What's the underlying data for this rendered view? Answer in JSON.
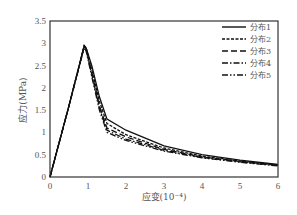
{
  "chart_data": {
    "type": "line",
    "title": "",
    "xlabel": "应变(10⁻⁴)",
    "ylabel": "应力(MPa)",
    "xlim": [
      0,
      6
    ],
    "ylim": [
      0,
      3.5
    ],
    "x_ticks": [
      "0",
      "1",
      "2",
      "3",
      "4",
      "5",
      "6"
    ],
    "y_ticks": [
      "0",
      "0.5",
      "1",
      "1.5",
      "2",
      "2.5",
      "3",
      "3.5"
    ],
    "grid": false,
    "legend_position": "upper right",
    "series": [
      {
        "name": "分布1",
        "style": "solid",
        "x": [
          0,
          0.5,
          0.9,
          0.95,
          1.1,
          1.3,
          1.5,
          2,
          3,
          4,
          5,
          6
        ],
        "y": [
          0,
          1.6,
          2.95,
          2.9,
          2.5,
          1.8,
          1.3,
          1.05,
          0.7,
          0.5,
          0.38,
          0.28
        ]
      },
      {
        "name": "分布2",
        "style": "dashed",
        "x": [
          0,
          0.5,
          0.9,
          0.95,
          1.1,
          1.3,
          1.5,
          2,
          3,
          4,
          5,
          6
        ],
        "y": [
          0,
          1.6,
          2.95,
          2.9,
          2.4,
          1.7,
          1.2,
          0.95,
          0.65,
          0.47,
          0.36,
          0.27
        ]
      },
      {
        "name": "分布3",
        "style": "long-dash",
        "x": [
          0,
          0.5,
          0.9,
          0.95,
          1.1,
          1.3,
          1.5,
          2,
          3,
          4,
          5,
          6
        ],
        "y": [
          0,
          1.6,
          2.93,
          2.88,
          2.35,
          1.6,
          1.1,
          0.9,
          0.62,
          0.45,
          0.35,
          0.26
        ]
      },
      {
        "name": "分布4",
        "style": "dash-dot",
        "x": [
          0,
          0.5,
          0.9,
          0.95,
          1.1,
          1.3,
          1.5,
          2,
          3,
          4,
          5,
          6
        ],
        "y": [
          0,
          1.6,
          2.92,
          2.85,
          2.3,
          1.55,
          1.05,
          0.85,
          0.6,
          0.44,
          0.34,
          0.26
        ]
      },
      {
        "name": "分布5",
        "style": "dash-dot-dot",
        "x": [
          0,
          0.5,
          0.9,
          0.95,
          1.1,
          1.3,
          1.5,
          2,
          3,
          4,
          5,
          6
        ],
        "y": [
          0,
          1.6,
          2.9,
          2.83,
          2.25,
          1.5,
          1.0,
          0.82,
          0.58,
          0.43,
          0.33,
          0.25
        ]
      }
    ]
  }
}
